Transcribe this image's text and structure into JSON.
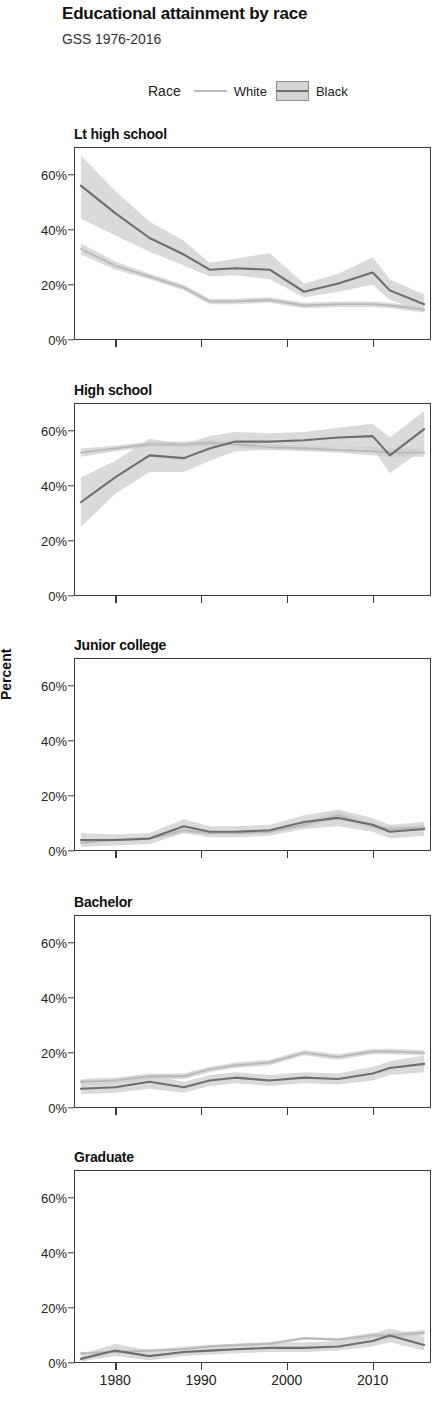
{
  "header": {
    "title": "Educational attainment by race",
    "subtitle": "GSS 1976-2016"
  },
  "legend": {
    "title": "Race",
    "entries": [
      {
        "label": "White",
        "marker": "line",
        "color": "#b9b9b9"
      },
      {
        "label": "Black",
        "marker": "box-with-line",
        "color": "#6e6e6e",
        "band_color": "#d5d5d5"
      }
    ]
  },
  "axes": {
    "ylabel": "Percent",
    "yticks": [
      "0%",
      "20%",
      "40%",
      "60%"
    ],
    "ytick_values": [
      0,
      20,
      40,
      60
    ],
    "ylim": [
      0,
      70
    ],
    "xticks": [
      "1980",
      "1990",
      "2000",
      "2010"
    ],
    "xtick_values": [
      1980,
      1990,
      2000,
      2010
    ],
    "xlim": [
      1975.2,
      2016.8
    ],
    "grid": false
  },
  "chart_data": {
    "type": "line",
    "title": "Educational attainment by race",
    "subtitle": "GSS 1976-2016",
    "xlabel": "",
    "ylabel": "Percent",
    "ylim": [
      0,
      70
    ],
    "xlim": [
      1975.2,
      2016.8
    ],
    "legend_position": "top-center",
    "legend_title": "Race",
    "facets": [
      {
        "title": "Lt high school",
        "x": [
          1976,
          1980,
          1984,
          1988,
          1991,
          1994,
          1998,
          2002,
          2006,
          2010,
          2012,
          2016
        ],
        "series": [
          {
            "name": "White",
            "color": "#b9b9b9",
            "values": [
              33,
              27,
              23,
              19,
              14,
              14,
              14.5,
              12.5,
              13,
              13,
              12.5,
              11
            ],
            "ci_low": [
              31,
              25.5,
              22,
              18,
              13,
              13,
              13.5,
              11.5,
              12,
              12,
              11.5,
              10
            ],
            "ci_high": [
              35,
              28.5,
              24,
              20,
              15,
              15,
              15.5,
              13.5,
              14,
              14,
              13.5,
              12
            ]
          },
          {
            "name": "Black",
            "color": "#6e6e6e",
            "values": [
              56,
              46,
              37,
              31,
              25.5,
              26,
              25.5,
              17.5,
              20.5,
              24.5,
              18,
              13
            ],
            "ci_low": [
              44,
              38,
              32,
              27,
              23,
              23.5,
              22,
              15.5,
              17.5,
              20,
              14.5,
              10.5
            ],
            "ci_high": [
              67,
              54,
              43,
              36,
              28,
              29.5,
              31.5,
              20.5,
              24,
              30,
              22,
              16.5
            ]
          }
        ]
      },
      {
        "title": "High school",
        "x": [
          1976,
          1980,
          1984,
          1988,
          1991,
          1994,
          1998,
          2002,
          2006,
          2010,
          2012,
          2016
        ],
        "series": [
          {
            "name": "White",
            "color": "#b9b9b9",
            "values": [
              52,
              53.5,
              55,
              55,
              55.5,
              55,
              54,
              53.5,
              53,
              52.5,
              52,
              52
            ],
            "ci_low": [
              50.5,
              52.5,
              54,
              54,
              54.5,
              54,
              53,
              52.5,
              52,
              51,
              50.5,
              50.5
            ],
            "ci_high": [
              53.5,
              54.5,
              56,
              56,
              56.5,
              56,
              55,
              54.5,
              54,
              54,
              53.5,
              53.5
            ]
          },
          {
            "name": "Black",
            "color": "#6e6e6e",
            "values": [
              34,
              43,
              51,
              50,
              53.5,
              56,
              56,
              56.5,
              57.5,
              58,
              51,
              60.5
            ],
            "ci_low": [
              25,
              37,
              45,
              45,
              49,
              52.5,
              53,
              53,
              54,
              53.5,
              44.5,
              53.5
            ],
            "ci_high": [
              43,
              49,
              57,
              55,
              58,
              59.5,
              59,
              59.5,
              61,
              62.5,
              57.5,
              67
            ]
          }
        ]
      },
      {
        "title": "Junior college",
        "x": [
          1976,
          1980,
          1984,
          1988,
          1991,
          1994,
          1998,
          2002,
          2006,
          2010,
          2012,
          2016
        ],
        "series": [
          {
            "name": "White",
            "color": "#b9b9b9",
            "values": [
              3,
              4,
              4.5,
              7.5,
              6.5,
              6.5,
              7,
              9.5,
              13,
              9,
              8,
              8.5
            ],
            "ci_low": [
              2.5,
              3.5,
              4,
              6.5,
              6,
              6,
              6.5,
              8.5,
              11.5,
              8,
              7,
              7.5
            ],
            "ci_high": [
              3.5,
              4.5,
              5,
              8.5,
              7,
              7,
              7.5,
              10.5,
              14.5,
              10,
              9,
              9.5
            ]
          },
          {
            "name": "Black",
            "color": "#6e6e6e",
            "values": [
              4,
              4,
              4.5,
              9,
              7,
              7,
              7.5,
              10.5,
              12,
              9.5,
              7,
              8
            ],
            "ci_low": [
              1.5,
              2,
              2.5,
              6.5,
              5,
              5,
              5.5,
              8,
              9,
              7,
              4.5,
              5.5
            ],
            "ci_high": [
              6.5,
              6,
              6.5,
              11.5,
              9,
              9,
              9.5,
              13,
              15,
              12,
              9.5,
              10.5
            ]
          }
        ]
      },
      {
        "title": "Bachelor",
        "x": [
          1976,
          1980,
          1984,
          1988,
          1991,
          1994,
          1998,
          2002,
          2006,
          2010,
          2012,
          2016
        ],
        "series": [
          {
            "name": "White",
            "color": "#b9b9b9",
            "values": [
              9.5,
              10,
              11.5,
              11.5,
              14,
              15.5,
              16.5,
              20,
              18.5,
              20.5,
              20.5,
              20
            ],
            "ci_low": [
              8.5,
              9,
              10.5,
              10.5,
              13,
              14.5,
              15.5,
              19,
              17.5,
              19.5,
              19.5,
              19
            ],
            "ci_high": [
              10.5,
              11,
              12.5,
              12.5,
              15,
              16.5,
              17.5,
              21,
              19.5,
              21.5,
              21.5,
              21
            ]
          },
          {
            "name": "Black",
            "color": "#6e6e6e",
            "values": [
              7,
              7.5,
              9.5,
              7.5,
              10,
              11,
              10,
              11,
              10.5,
              12.5,
              14.5,
              16
            ],
            "ci_low": [
              5,
              5.5,
              7,
              5.5,
              8,
              9,
              8,
              9,
              8.5,
              10,
              12,
              13
            ],
            "ci_high": [
              9,
              9.5,
              12,
              9.5,
              12,
              13,
              12,
              13,
              12.5,
              15,
              17,
              19
            ]
          }
        ]
      },
      {
        "title": "Graduate",
        "x": [
          1976,
          1980,
          1984,
          1988,
          1991,
          1994,
          1998,
          2002,
          2006,
          2010,
          2012,
          2016
        ],
        "series": [
          {
            "name": "White",
            "color": "#b9b9b9",
            "values": [
              3.5,
              4,
              4.5,
              5,
              6,
              6.5,
              7,
              9,
              8.5,
              10,
              10,
              11
            ],
            "ci_low": [
              3,
              3.5,
              4,
              4.5,
              5.5,
              6,
              6.5,
              8.5,
              8,
              9,
              9,
              10
            ],
            "ci_high": [
              4,
              4.5,
              5,
              5.5,
              6.5,
              7,
              7.5,
              9.5,
              9,
              11,
              11,
              12
            ]
          },
          {
            "name": "Black",
            "color": "#6e6e6e",
            "values": [
              1.5,
              4.5,
              2.5,
              4,
              4.5,
              5,
              5.5,
              5.5,
              6,
              8,
              10,
              6.5
            ],
            "ci_low": [
              0.5,
              2.5,
              1,
              2.5,
              3,
              3.5,
              4,
              4,
              4.5,
              6,
              7.5,
              4.5
            ],
            "ci_high": [
              3,
              7,
              4.5,
              6,
              6.5,
              7,
              7.5,
              7.5,
              8,
              10.5,
              12.5,
              9.5
            ]
          }
        ]
      }
    ]
  }
}
